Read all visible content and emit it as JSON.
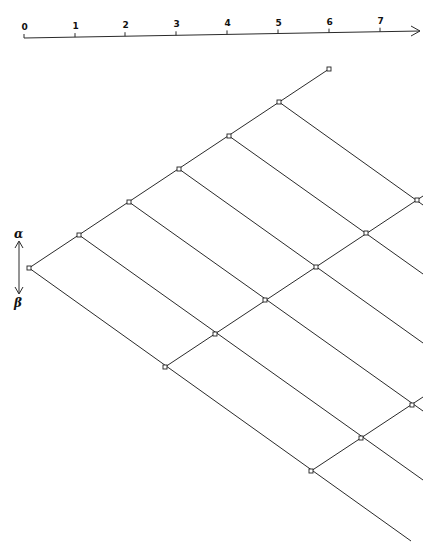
{
  "axis": {
    "start": [
      24,
      38
    ],
    "end": [
      420,
      31
    ],
    "arrow": "right-arrow",
    "ticks": [
      {
        "label": "0",
        "x": 24
      },
      {
        "label": "1",
        "x": 75
      },
      {
        "label": "2",
        "x": 125
      },
      {
        "label": "3",
        "x": 176
      },
      {
        "label": "4",
        "x": 227
      },
      {
        "label": "5",
        "x": 278
      },
      {
        "label": "6",
        "x": 329
      },
      {
        "label": "7",
        "x": 380
      }
    ]
  },
  "direction_indicator": {
    "top_label": "α",
    "bottom_label": "β",
    "icon": "double-vertical-arrow-icon"
  },
  "lattice": {
    "line_color": "#2a2a2a",
    "up_lines": [
      [
        [
          29,
          268
        ],
        [
          329,
          69
        ]
      ],
      [
        [
          165,
          367
        ],
        [
          423,
          196
        ]
      ],
      [
        [
          311,
          471
        ],
        [
          423,
          397
        ]
      ]
    ],
    "down_lines": [
      [
        [
          29,
          268
        ],
        [
          411,
          541
        ]
      ],
      [
        [
          79,
          235
        ],
        [
          423,
          480
        ]
      ],
      [
        [
          129,
          202
        ],
        [
          423,
          411
        ]
      ],
      [
        [
          179,
          169
        ],
        [
          423,
          343
        ]
      ],
      [
        [
          229,
          136
        ],
        [
          423,
          274
        ]
      ],
      [
        [
          279,
          102
        ],
        [
          423,
          205
        ]
      ]
    ],
    "nodes": [
      [
        29,
        268
      ],
      [
        79,
        235
      ],
      [
        129,
        202
      ],
      [
        179,
        169
      ],
      [
        229,
        136
      ],
      [
        279,
        102
      ],
      [
        329,
        69
      ],
      [
        165,
        367
      ],
      [
        215,
        334
      ],
      [
        265,
        300
      ],
      [
        316,
        267
      ],
      [
        366,
        233
      ],
      [
        417,
        200
      ],
      [
        311,
        471
      ],
      [
        361,
        438
      ],
      [
        412,
        405
      ]
    ]
  }
}
